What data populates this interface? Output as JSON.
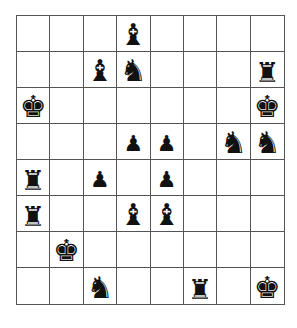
{
  "board": {
    "rows": 8,
    "cols": 8,
    "piece_color": "black",
    "cells": [
      [
        "",
        "",
        "",
        "bishop",
        "",
        "",
        "",
        ""
      ],
      [
        "",
        "",
        "bishop",
        "knight",
        "",
        "",
        "",
        "rook"
      ],
      [
        "king",
        "",
        "",
        "",
        "",
        "",
        "",
        "king"
      ],
      [
        "",
        "",
        "",
        "pawn",
        "pawn",
        "",
        "knight",
        "knight"
      ],
      [
        "rook",
        "",
        "pawn",
        "",
        "pawn",
        "",
        "",
        ""
      ],
      [
        "rook",
        "",
        "",
        "bishop",
        "bishop",
        "",
        "",
        ""
      ],
      [
        "",
        "king",
        "",
        "",
        "",
        "",
        "",
        ""
      ],
      [
        "",
        "",
        "knight",
        "",
        "",
        "rook",
        "",
        "king"
      ]
    ]
  },
  "glyphs": {
    "king": "♚",
    "queen": "♛",
    "rook": "♜",
    "bishop": "♝",
    "knight": "♞",
    "pawn": "♟"
  },
  "colors": {
    "square": "#ffffff",
    "grid_line": "#555555",
    "piece": "#111111"
  }
}
